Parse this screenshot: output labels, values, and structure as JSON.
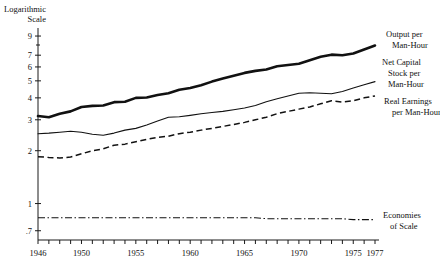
{
  "chart_data": {
    "type": "line",
    "title": "",
    "subtitle": "",
    "ylabel_line1": "Logarithmic",
    "ylabel_line2": "Scale",
    "xlabel": "",
    "yscale": "log",
    "ylim": [
      0.62,
      10.0
    ],
    "xlim": [
      1946,
      1977
    ],
    "grid": false,
    "legend_position": "right-of-plot-inline",
    "ytick_labels": [
      ".7",
      "1",
      "2",
      "3",
      "4",
      "5",
      "6",
      "7",
      "9"
    ],
    "ytick_values": [
      0.7,
      1,
      2,
      3,
      4,
      5,
      6,
      7,
      9
    ],
    "xtick_labels": [
      "1946",
      "1950",
      "1955",
      "1960",
      "1965",
      "1970",
      "1975",
      "1977"
    ],
    "xtick_values": [
      1946,
      1950,
      1955,
      1960,
      1965,
      1970,
      1975,
      1977
    ],
    "x": [
      1946,
      1947,
      1948,
      1949,
      1950,
      1951,
      1952,
      1953,
      1954,
      1955,
      1956,
      1957,
      1958,
      1959,
      1960,
      1961,
      1962,
      1963,
      1964,
      1965,
      1966,
      1967,
      1968,
      1969,
      1970,
      1971,
      1972,
      1973,
      1974,
      1975,
      1976,
      1977
    ],
    "series": [
      {
        "name": "Output per Man-Hour",
        "label_line1": "Output per",
        "label_line2": "Man-Hour",
        "style": "thick-solid",
        "values": [
          3.15,
          3.1,
          3.25,
          3.35,
          3.55,
          3.6,
          3.62,
          3.78,
          3.8,
          4.0,
          4.02,
          4.15,
          4.25,
          4.45,
          4.55,
          4.72,
          4.95,
          5.15,
          5.35,
          5.55,
          5.7,
          5.8,
          6.05,
          6.15,
          6.25,
          6.55,
          6.85,
          7.05,
          7.0,
          7.15,
          7.55,
          7.95
        ]
      },
      {
        "name": "Net Capital Stock per Man-Hour",
        "label_line1": "Net Capital",
        "label_line2": "Stock per",
        "label_line3": "Man-Hour",
        "style": "thin-solid",
        "values": [
          2.5,
          2.52,
          2.55,
          2.58,
          2.55,
          2.48,
          2.45,
          2.52,
          2.62,
          2.68,
          2.8,
          2.95,
          3.1,
          3.12,
          3.18,
          3.25,
          3.3,
          3.35,
          3.42,
          3.5,
          3.62,
          3.8,
          3.95,
          4.1,
          4.25,
          4.28,
          4.25,
          4.22,
          4.35,
          4.55,
          4.75,
          4.95
        ]
      },
      {
        "name": "Real Earnings per Man-Hour",
        "label_line1": "Real Earnings",
        "label_line2": "per Man-Hour",
        "style": "dashed",
        "values": [
          1.85,
          1.83,
          1.82,
          1.84,
          1.92,
          2.0,
          2.05,
          2.15,
          2.18,
          2.25,
          2.32,
          2.38,
          2.42,
          2.5,
          2.55,
          2.62,
          2.68,
          2.75,
          2.82,
          2.9,
          3.0,
          3.1,
          3.25,
          3.35,
          3.45,
          3.55,
          3.7,
          3.85,
          3.78,
          3.85,
          4.0,
          4.1
        ]
      },
      {
        "name": "Economies of Scale",
        "label_line1": "Economies",
        "label_line2": "of Scale",
        "style": "dash-dot",
        "values": [
          0.83,
          0.83,
          0.83,
          0.83,
          0.83,
          0.83,
          0.83,
          0.83,
          0.83,
          0.83,
          0.83,
          0.83,
          0.83,
          0.83,
          0.83,
          0.83,
          0.83,
          0.83,
          0.83,
          0.83,
          0.83,
          0.82,
          0.82,
          0.82,
          0.82,
          0.82,
          0.82,
          0.82,
          0.82,
          0.81,
          0.81,
          0.81
        ]
      }
    ]
  },
  "colors": {
    "ink": "#111111",
    "background": "#ffffff"
  }
}
